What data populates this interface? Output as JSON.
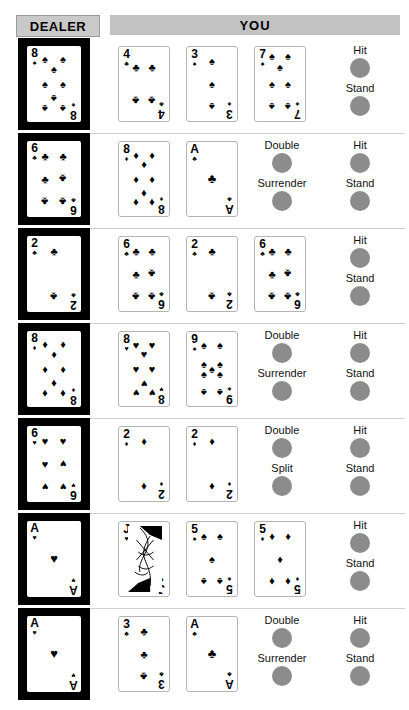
{
  "header": {
    "dealer_label": "DEALER",
    "you_label": "YOU"
  },
  "colors": {
    "dealer_block": "#000000",
    "header_gray": "#c2c2c2",
    "button_gray": "#8c8c8c",
    "card_white": "#ffffff",
    "divider": "#cfcfcf"
  },
  "suits": {
    "spade": "♠",
    "heart": "♥",
    "club": "♣",
    "diamond": "♦"
  },
  "rows": [
    {
      "id": "row-1",
      "dealer": {
        "rank": "8",
        "suit": "spade",
        "pips": 8
      },
      "player": [
        {
          "rank": "4",
          "suit": "club",
          "pips": 4
        },
        {
          "rank": "3",
          "suit": "spade",
          "pips": 3
        },
        {
          "rank": "7",
          "suit": "spade",
          "pips": 7
        }
      ],
      "actions_left": [],
      "actions_right": [
        "Hit",
        "Stand"
      ]
    },
    {
      "id": "row-2",
      "dealer": {
        "rank": "6",
        "suit": "club",
        "pips": 6
      },
      "player": [
        {
          "rank": "8",
          "suit": "diamond",
          "pips": 8
        },
        {
          "rank": "A",
          "suit": "club",
          "pips": 1
        }
      ],
      "actions_left": [
        "Double",
        "Surrender"
      ],
      "actions_right": [
        "Hit",
        "Stand"
      ]
    },
    {
      "id": "row-3",
      "dealer": {
        "rank": "2",
        "suit": "club",
        "pips": 2
      },
      "player": [
        {
          "rank": "6",
          "suit": "club",
          "pips": 6
        },
        {
          "rank": "2",
          "suit": "club",
          "pips": 2
        },
        {
          "rank": "6",
          "suit": "club",
          "pips": 6
        }
      ],
      "actions_left": [],
      "actions_right": [
        "Hit",
        "Stand"
      ]
    },
    {
      "id": "row-4",
      "dealer": {
        "rank": "8",
        "suit": "diamond",
        "pips": 8
      },
      "player": [
        {
          "rank": "8",
          "suit": "heart",
          "pips": 8
        },
        {
          "rank": "9",
          "suit": "spade",
          "pips": 9
        }
      ],
      "actions_left": [
        "Double",
        "Surrender"
      ],
      "actions_right": [
        "Hit",
        "Stand"
      ]
    },
    {
      "id": "row-5",
      "dealer": {
        "rank": "6",
        "suit": "heart",
        "pips": 6
      },
      "player": [
        {
          "rank": "2",
          "suit": "diamond",
          "pips": 2
        },
        {
          "rank": "2",
          "suit": "diamond",
          "pips": 2
        }
      ],
      "actions_left": [
        "Double",
        "Split"
      ],
      "actions_right": [
        "Hit",
        "Stand"
      ]
    },
    {
      "id": "row-6",
      "dealer": {
        "rank": "A",
        "suit": "heart",
        "pips": 1
      },
      "player": [
        {
          "rank": "J",
          "suit": "heart",
          "pips": 0,
          "face": true
        },
        {
          "rank": "5",
          "suit": "spade",
          "pips": 5
        },
        {
          "rank": "5",
          "suit": "diamond",
          "pips": 5
        }
      ],
      "actions_left": [],
      "actions_right": [
        "Hit",
        "Stand"
      ]
    },
    {
      "id": "row-7",
      "dealer": {
        "rank": "A",
        "suit": "heart",
        "pips": 1
      },
      "player": [
        {
          "rank": "3",
          "suit": "club",
          "pips": 3
        },
        {
          "rank": "A",
          "suit": "club",
          "pips": 1
        }
      ],
      "actions_left": [
        "Double",
        "Surrender"
      ],
      "actions_right": [
        "Hit",
        "Stand"
      ]
    }
  ]
}
